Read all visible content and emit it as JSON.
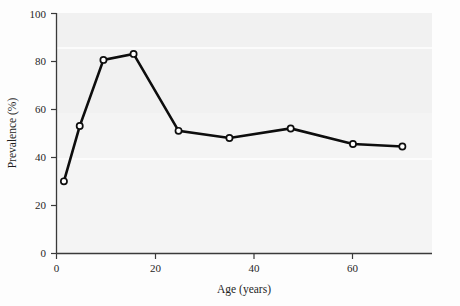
{
  "chart_data": {
    "type": "line",
    "title": "",
    "xlabel": "Age (years)",
    "ylabel": "Prevalence (%)",
    "xlim": [
      0,
      76
    ],
    "ylim": [
      0,
      100
    ],
    "xticks": [
      0,
      20,
      40,
      60
    ],
    "yticks": [
      0,
      20,
      40,
      60,
      80,
      100
    ],
    "xtick_labels": [
      "0",
      "20",
      "40",
      "60"
    ],
    "ytick_labels": [
      "0",
      "20",
      "40",
      "60",
      "80",
      "100"
    ],
    "grid": false,
    "legend": null,
    "marker": "open-circle",
    "line_color": "#0d0d0d",
    "marker_face_color": "#ffffff",
    "series": [
      {
        "name": "Prevalence",
        "x": [
          1.5,
          4.7,
          9.5,
          15.6,
          24.7,
          35.0,
          47.4,
          60.0,
          70.0
        ],
        "values": [
          30,
          53,
          80.5,
          83,
          51,
          48,
          52,
          45.5,
          44.5
        ]
      }
    ]
  },
  "figure": {
    "x_axis_title": "Age (years)",
    "y_axis_title": "Prevalence (%)",
    "background_color": "#f2f2f2",
    "axis_color": "#3a3a3a",
    "data_color": "#0d0d0d"
  }
}
